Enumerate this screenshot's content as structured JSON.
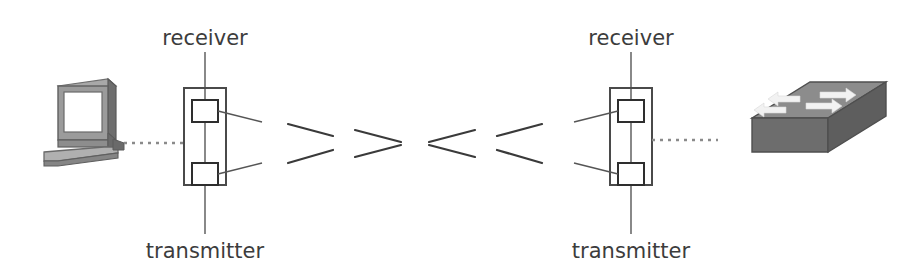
{
  "figure": {
    "type": "free-space-optical-link-diagram",
    "background_color": "#ffffff",
    "width": 905,
    "height": 274
  },
  "palette": {
    "label_text": "#3c3c3c",
    "module_outline": "#4a4a4a",
    "port_outline": "#2e2e2e",
    "leader_line": "#555555",
    "stem_line": "#6b6b6b",
    "beam_line": "#3a3a3a",
    "dotted_link": "#8a8a8a",
    "device_mid_gray": "#8c8c8c",
    "device_dark_gray": "#5e5e5e",
    "device_light_gray": "#b4b4b4",
    "device_screen": "#ffffff",
    "switch_arrow": "#f2f2f2"
  },
  "labels": {
    "left_receiver": "receiver",
    "left_transmitter": "transmitter",
    "right_receiver": "receiver",
    "right_transmitter": "transmitter"
  },
  "devices": {
    "left": {
      "name": "computer",
      "icon": "desktop-computer-icon",
      "description": "CRT monitor with keyboard"
    },
    "right": {
      "name": "switch",
      "icon": "network-switch-icon",
      "description": "network switch with four directional arrows",
      "arrow_count": 4
    }
  },
  "modules": {
    "left": {
      "name": "transceiver-module",
      "ports": [
        "receiver-port",
        "transmitter-port"
      ]
    },
    "right": {
      "name": "transceiver-module",
      "ports": [
        "receiver-port",
        "transmitter-port"
      ]
    }
  },
  "links": {
    "left_cable": "dotted",
    "right_cable": "dotted",
    "beam": {
      "name": "free-space-optical-beam",
      "segments": 8,
      "pattern": "diverging-then-converging"
    }
  }
}
